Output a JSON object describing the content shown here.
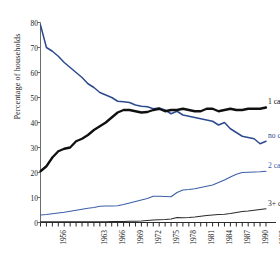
{
  "chart_data": {
    "type": "line",
    "title": "",
    "xlabel": "",
    "ylabel": "Percentage of households",
    "xlim": [
      1956,
      1994
    ],
    "ylim": [
      0,
      80
    ],
    "grid": false,
    "legend_position": "right-inline",
    "ytick_labels": [
      "0",
      "10",
      "20",
      "30",
      "40",
      "50",
      "60",
      "70",
      "80"
    ],
    "ytick_values": [
      0,
      10,
      20,
      30,
      40,
      50,
      60,
      70,
      80
    ],
    "xtick_labels": [
      "1956",
      "1963",
      "1966",
      "1969",
      "1972",
      "1975",
      "1978",
      "1981",
      "1984",
      "1987",
      "1990",
      "1993"
    ],
    "xtick_values": [
      1956,
      1963,
      1966,
      1969,
      1972,
      1975,
      1978,
      1981,
      1984,
      1987,
      1990,
      1993
    ],
    "x": [
      1956,
      1957,
      1958,
      1959,
      1960,
      1961,
      1962,
      1963,
      1964,
      1965,
      1966,
      1967,
      1968,
      1969,
      1970,
      1971,
      1972,
      1973,
      1974,
      1975,
      1976,
      1977,
      1978,
      1979,
      1980,
      1981,
      1982,
      1983,
      1984,
      1985,
      1986,
      1987,
      1988,
      1989,
      1990,
      1991,
      1992,
      1993,
      1994
    ],
    "series": [
      {
        "name": "no car",
        "color": "#2e4a8f",
        "label": "no car",
        "label_value": 33.0,
        "values": [
          79.0,
          70.0,
          68.5,
          66.5,
          64.0,
          62.0,
          60.0,
          58.0,
          55.5,
          54.0,
          52.0,
          51.0,
          50.0,
          48.5,
          48.3,
          48.0,
          47.0,
          46.5,
          46.3,
          45.5,
          45.8,
          45.0,
          43.5,
          44.5,
          43.0,
          42.5,
          42.0,
          41.5,
          41.0,
          40.5,
          39.0,
          40.0,
          37.5,
          36.0,
          34.5,
          34.0,
          33.5,
          31.5,
          32.5
        ]
      },
      {
        "name": "1 car",
        "color": "#101010",
        "label": "1 car",
        "label_value": 46.5,
        "values": [
          20.5,
          22.5,
          26.0,
          28.5,
          29.5,
          30.0,
          32.5,
          33.5,
          35.0,
          37.0,
          38.5,
          40.0,
          42.0,
          44.0,
          45.0,
          45.0,
          44.5,
          44.0,
          44.2,
          45.0,
          45.5,
          44.5,
          45.0,
          45.0,
          45.5,
          45.0,
          44.5,
          44.5,
          45.5,
          45.5,
          44.5,
          45.0,
          45.5,
          45.0,
          45.0,
          45.5,
          45.5,
          45.5,
          46.0
        ]
      },
      {
        "name": "2 cars",
        "color": "#3c5fa8",
        "label": "2 cars",
        "label_value": 21.0,
        "values": [
          3.0,
          3.2,
          3.5,
          3.8,
          4.1,
          4.5,
          4.9,
          5.3,
          5.7,
          6.0,
          6.5,
          6.6,
          6.6,
          6.7,
          7.2,
          7.8,
          8.4,
          9.0,
          9.6,
          10.5,
          10.5,
          10.4,
          10.3,
          12.0,
          13.0,
          13.2,
          13.5,
          14.0,
          14.5,
          15.0,
          16.0,
          17.0,
          18.2,
          19.3,
          20.0,
          20.1,
          20.2,
          20.3,
          20.5
        ]
      },
      {
        "name": "3+ cars",
        "color": "#2b2b2b",
        "label": "3+ cars",
        "label_value": 6.0,
        "values": [
          0.3,
          0.3,
          0.3,
          0.3,
          0.3,
          0.3,
          0.3,
          0.3,
          0.3,
          0.3,
          0.3,
          0.3,
          0.4,
          0.4,
          0.4,
          0.5,
          0.5,
          0.6,
          0.8,
          1.0,
          1.1,
          1.2,
          1.4,
          2.0,
          1.9,
          2.0,
          2.2,
          2.5,
          2.8,
          3.0,
          3.2,
          3.3,
          3.6,
          4.0,
          4.4,
          4.6,
          4.9,
          5.2,
          5.5
        ]
      }
    ]
  }
}
